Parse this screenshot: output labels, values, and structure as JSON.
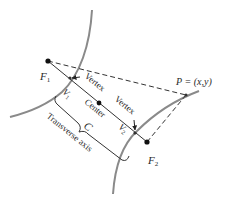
{
  "figure": {
    "type": "hyperbola-diagram",
    "colors": {
      "curve": "#8a8a8a",
      "line": "#333333",
      "point": "#111111",
      "background": "#ffffff"
    },
    "labels": {
      "focus1": "F",
      "focus1_sub": "1",
      "focus2": "F",
      "focus2_sub": "2",
      "vertex1": "V",
      "vertex1_sub": "1",
      "vertex2": "V",
      "vertex2_sub": "2",
      "vertex_arrow1": "Vertex",
      "vertex_arrow2": "Vertex",
      "center": "Center",
      "center_letter": "C",
      "transverse_axis": "Transverse axis",
      "point_p": "P = (x,y)"
    }
  }
}
